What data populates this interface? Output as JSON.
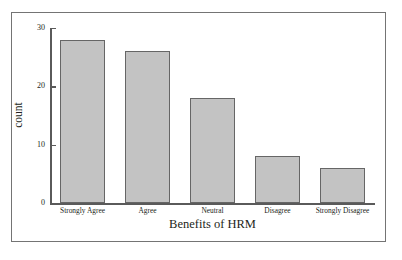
{
  "chart_data": {
    "type": "bar",
    "title": "",
    "categories": [
      "Strongly Agree",
      "Agree",
      "Neutral",
      "Disagree",
      "Strongly Disagree"
    ],
    "values": [
      28,
      26,
      18,
      8,
      6
    ],
    "xlabel": "Benefits of HRM",
    "ylabel": "count",
    "ylim": [
      0,
      30
    ],
    "yticks": [
      0,
      10,
      20,
      30
    ],
    "ytick_labels": [
      "0",
      "10",
      "20",
      "30"
    ],
    "grid": false,
    "legend": false,
    "bar_fill_color": "#c3c3c3",
    "bar_edge_color": "#666666",
    "axis_color": "#5a5a5a",
    "frame_color": "#747474",
    "text_color": "#231f20"
  }
}
